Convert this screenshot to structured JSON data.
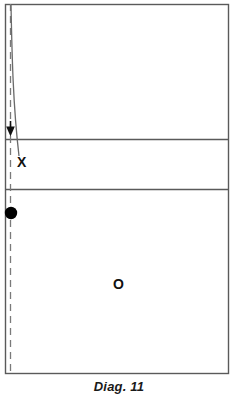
{
  "figure": {
    "caption": "Diag. 11",
    "background_color": "#ffffff",
    "width": 238,
    "height": 396
  },
  "court": {
    "name": "court-outline",
    "line_color": "#555555",
    "border": {
      "x": 5,
      "y": 4,
      "width": 224,
      "height": 370
    },
    "horizontal_lines": [
      {
        "name": "attack-line-upper",
        "y": 139,
        "x_start": 5,
        "x_end": 229
      },
      {
        "name": "attack-line-lower",
        "y": 189,
        "x_start": 5,
        "x_end": 229
      }
    ]
  },
  "sideline": {
    "name": "dashed-sideline",
    "x": 10,
    "y_start": 4,
    "y_end": 374,
    "style": "dashed",
    "color": "#777777",
    "dash_length": 7,
    "dash_gap": 5
  },
  "trajectory": {
    "name": "ball-path",
    "style": "solid-curve",
    "color": "#666666",
    "start": {
      "x": 11,
      "y": 5
    },
    "control": {
      "x": 13,
      "y": 80
    },
    "end": {
      "x": 19,
      "y": 156
    }
  },
  "arrow": {
    "name": "direction-arrow",
    "direction": "down",
    "color": "#111111",
    "tip": {
      "x": 10,
      "y": 136
    },
    "tail_y": 122,
    "width": 9
  },
  "markers": [
    {
      "name": "ball-marker",
      "shape": "filled-circle",
      "label": "",
      "color": "#000000",
      "cx": 11,
      "cy": 213,
      "r": 6
    },
    {
      "name": "player-x-marker",
      "shape": "letter",
      "label": "X",
      "color": "#111111",
      "x": 18,
      "y": 158
    },
    {
      "name": "player-o-marker",
      "shape": "letter",
      "label": "O",
      "color": "#111111",
      "x": 119,
      "y": 284
    }
  ],
  "colors": {
    "ink": "#111111",
    "court_line": "#555555",
    "dash_line": "#777777",
    "path_line": "#666666",
    "paper": "#ffffff"
  }
}
